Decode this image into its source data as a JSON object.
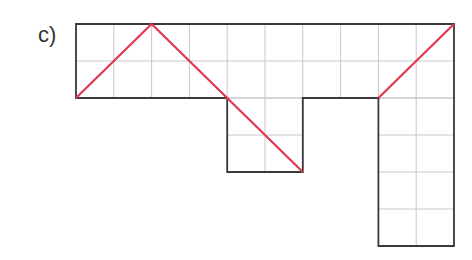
{
  "label": "c)",
  "grid": {
    "origin_x": 76,
    "origin_y": 24,
    "cell_w": 37.8,
    "cell_h": 37,
    "cells": [
      {
        "cols": [
          0,
          10
        ],
        "rows": [
          0,
          2
        ]
      },
      {
        "cols": [
          4,
          6
        ],
        "rows": [
          2,
          4
        ]
      },
      {
        "cols": [
          8,
          10
        ],
        "rows": [
          2,
          6
        ]
      }
    ]
  },
  "outline": [
    [
      0,
      0
    ],
    [
      10,
      0
    ],
    [
      10,
      6
    ],
    [
      8,
      6
    ],
    [
      8,
      2
    ],
    [
      6,
      2
    ],
    [
      6,
      4
    ],
    [
      4,
      4
    ],
    [
      4,
      2
    ],
    [
      0,
      2
    ]
  ],
  "red_path": [
    [
      0,
      2
    ],
    [
      2,
      0
    ],
    [
      6,
      4
    ]
  ],
  "red_path_2": [
    [
      8,
      2
    ],
    [
      10,
      0
    ]
  ],
  "colors": {
    "grid": "#c8c8c8",
    "outline": "#3a3a3a",
    "path": "#e0384e"
  }
}
